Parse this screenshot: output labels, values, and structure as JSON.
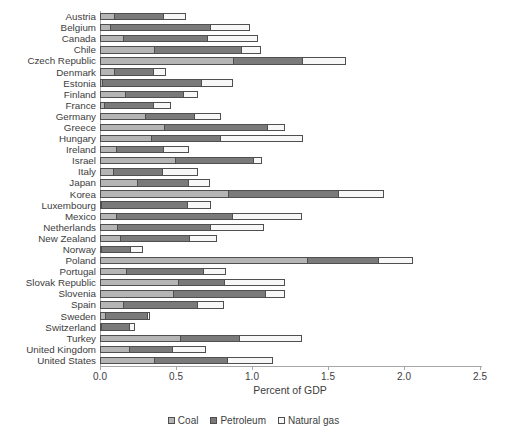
{
  "chart_data": {
    "type": "bar",
    "orientation": "horizontal",
    "stacked": true,
    "title": "",
    "xlabel": "Percent of GDP",
    "ylabel": "",
    "xlim": [
      0,
      2.5
    ],
    "xticks": [
      {
        "value": 0.0,
        "label": "0.0"
      },
      {
        "value": 0.5,
        "label": "0.5"
      },
      {
        "value": 1.0,
        "label": "1.0"
      },
      {
        "value": 1.5,
        "label": "1.5"
      },
      {
        "value": 2.0,
        "label": "2.0"
      },
      {
        "value": 2.5,
        "label": "2.5"
      }
    ],
    "grid": false,
    "legend_position": "bottom",
    "categories": [
      "Austria",
      "Belgium",
      "Canada",
      "Chile",
      "Czech Republic",
      "Denmark",
      "Estonia",
      "Finland",
      "France",
      "Germany",
      "Greece",
      "Hungary",
      "Ireland",
      "Israel",
      "Italy",
      "Japan",
      "Korea",
      "Luxembourg",
      "Mexico",
      "Netherlands",
      "New Zealand",
      "Norway",
      "Poland",
      "Portugal",
      "Slovak Republic",
      "Slovenia",
      "Spain",
      "Sweden",
      "Switzerland",
      "Turkey",
      "United Kingdom",
      "United States"
    ],
    "series": [
      {
        "name": "Coal",
        "color": "#b5b5b5",
        "values": [
          0.1,
          0.07,
          0.16,
          0.36,
          0.88,
          0.1,
          0.02,
          0.17,
          0.03,
          0.3,
          0.43,
          0.34,
          0.11,
          0.5,
          0.09,
          0.25,
          0.85,
          0.01,
          0.11,
          0.12,
          0.14,
          0.01,
          1.37,
          0.18,
          0.52,
          0.49,
          0.16,
          0.04,
          0.01,
          0.53,
          0.2,
          0.36
        ]
      },
      {
        "name": "Petroleum",
        "color": "#7a7a7a",
        "values": [
          0.33,
          0.67,
          0.56,
          0.58,
          0.46,
          0.26,
          0.66,
          0.39,
          0.33,
          0.33,
          0.68,
          0.46,
          0.32,
          0.52,
          0.33,
          0.34,
          0.73,
          0.57,
          0.77,
          0.62,
          0.46,
          0.2,
          0.47,
          0.51,
          0.31,
          0.61,
          0.49,
          0.28,
          0.19,
          0.4,
          0.29,
          0.49
        ]
      },
      {
        "name": "Natural gas",
        "color": "#f7f7f7",
        "values": [
          0.15,
          0.26,
          0.33,
          0.13,
          0.29,
          0.09,
          0.21,
          0.1,
          0.12,
          0.18,
          0.12,
          0.55,
          0.17,
          0.06,
          0.24,
          0.15,
          0.3,
          0.16,
          0.46,
          0.35,
          0.18,
          0.08,
          0.23,
          0.15,
          0.4,
          0.13,
          0.18,
          0.02,
          0.04,
          0.41,
          0.22,
          0.3
        ]
      }
    ]
  },
  "legend": {
    "items": [
      {
        "label": "Coal",
        "color": "#b5b5b5"
      },
      {
        "label": "Petroleum",
        "color": "#7a7a7a"
      },
      {
        "label": "Natural gas",
        "color": "#f7f7f7"
      }
    ]
  },
  "colors": {
    "bar_border": "#4f4f4f",
    "axis_line": "#a6a6a6",
    "text": "#3d3d3d"
  }
}
